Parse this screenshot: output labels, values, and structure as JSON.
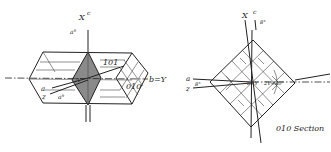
{
  "figure_left": {
    "title": "Crystal prism with indicatrix axes",
    "labels": {
      "x_axis": "X",
      "c_axis": "c",
      "a_top": "a°",
      "face_101": "101",
      "face_010": "010",
      "b_y": "b=Y",
      "a_left": "a",
      "z_left": "z",
      "a_deg": "a°",
      "center": "2V"
    },
    "colors": {
      "line": "#222222",
      "rhombus_fill": "#8a8a8a"
    }
  },
  "figure_right": {
    "caption": "010 Section",
    "labels": {
      "x_axis": "X",
      "c_axis": "c",
      "angle_top": "8°",
      "a": "a",
      "z": "z",
      "angle_left": "8°",
      "b_y": "b=Y",
      "two_v": "2V=80°"
    },
    "colors": {
      "line": "#222222"
    }
  }
}
